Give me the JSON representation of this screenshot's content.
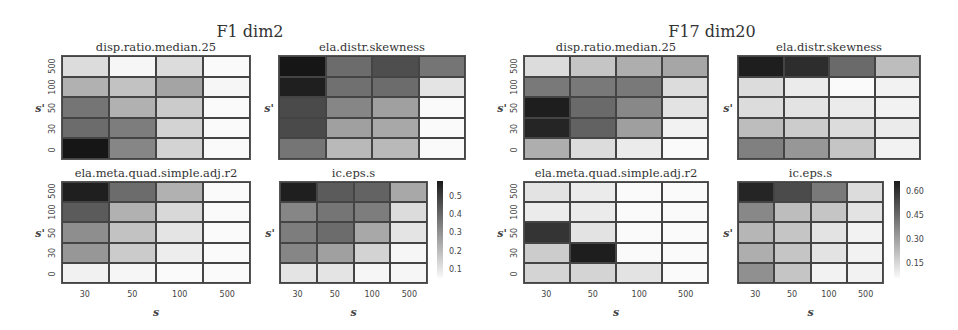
{
  "chart_data": [
    {
      "type": "heatmap",
      "group": "F1 dim2",
      "title": "disp.ratio.median.25",
      "xlabel": "s",
      "ylabel": "s'",
      "x_categories": [
        "30",
        "50",
        "100",
        "500"
      ],
      "y_categories": [
        "500",
        "100",
        "50",
        "30",
        "0"
      ],
      "values": [
        [
          0.12,
          0.06,
          0.12,
          0.05
        ],
        [
          0.22,
          0.18,
          0.25,
          0.06
        ],
        [
          0.36,
          0.22,
          0.16,
          0.05
        ],
        [
          0.38,
          0.34,
          0.14,
          0.05
        ],
        [
          0.58,
          0.32,
          0.14,
          0.05
        ]
      ]
    },
    {
      "type": "heatmap",
      "group": "F1 dim2",
      "title": "ela.distr.skewness",
      "xlabel": "s",
      "ylabel": "s'",
      "x_categories": [
        "30",
        "50",
        "100",
        "500"
      ],
      "y_categories": [
        "500",
        "100",
        "50",
        "30",
        "0"
      ],
      "values": [
        [
          0.58,
          0.38,
          0.45,
          0.36
        ],
        [
          0.56,
          0.37,
          0.38,
          0.1
        ],
        [
          0.46,
          0.32,
          0.26,
          0.05
        ],
        [
          0.46,
          0.26,
          0.24,
          0.05
        ],
        [
          0.36,
          0.2,
          0.2,
          0.05
        ]
      ]
    },
    {
      "type": "heatmap",
      "group": "F1 dim2",
      "title": "ela.meta.quad.simple.adj.r2",
      "xlabel": "s",
      "ylabel": "s'",
      "x_categories": [
        "30",
        "50",
        "100",
        "500"
      ],
      "y_categories": [
        "500",
        "100",
        "50",
        "30",
        "0"
      ],
      "values": [
        [
          0.56,
          0.38,
          0.22,
          0.05
        ],
        [
          0.42,
          0.22,
          0.13,
          0.05
        ],
        [
          0.3,
          0.18,
          0.1,
          0.05
        ],
        [
          0.28,
          0.16,
          0.08,
          0.05
        ],
        [
          0.07,
          0.06,
          0.05,
          0.05
        ]
      ]
    },
    {
      "type": "heatmap",
      "group": "F1 dim2",
      "title": "ic.eps.s",
      "xlabel": "s",
      "ylabel": "s'",
      "x_categories": [
        "30",
        "50",
        "100",
        "500"
      ],
      "y_categories": [
        "500",
        "100",
        "50",
        "30",
        "0"
      ],
      "values": [
        [
          0.56,
          0.42,
          0.4,
          0.24
        ],
        [
          0.32,
          0.36,
          0.34,
          0.12
        ],
        [
          0.34,
          0.38,
          0.24,
          0.1
        ],
        [
          0.32,
          0.26,
          0.14,
          0.06
        ],
        [
          0.1,
          0.1,
          0.06,
          0.06
        ]
      ],
      "colorbar": {
        "ticks": [
          "0.5",
          "0.4",
          "0.3",
          "0.2",
          "0.1"
        ],
        "range": [
          0.05,
          0.58
        ]
      }
    },
    {
      "type": "heatmap",
      "group": "F17 dim20",
      "title": "disp.ratio.median.25",
      "xlabel": "s",
      "ylabel": "s'",
      "x_categories": [
        "30",
        "50",
        "100",
        "500"
      ],
      "y_categories": [
        "500",
        "100",
        "50",
        "30",
        "0"
      ],
      "values": [
        [
          0.14,
          0.2,
          0.26,
          0.28
        ],
        [
          0.4,
          0.4,
          0.4,
          0.14
        ],
        [
          0.64,
          0.44,
          0.36,
          0.12
        ],
        [
          0.62,
          0.46,
          0.3,
          0.08
        ],
        [
          0.26,
          0.14,
          0.1,
          0.06
        ]
      ]
    },
    {
      "type": "heatmap",
      "group": "F17 dim20",
      "title": "ela.distr.skewness",
      "xlabel": "s",
      "ylabel": "s'",
      "x_categories": [
        "30",
        "50",
        "100",
        "500"
      ],
      "y_categories": [
        "500",
        "100",
        "50",
        "30",
        "0"
      ],
      "values": [
        [
          0.64,
          0.6,
          0.44,
          0.22
        ],
        [
          0.14,
          0.1,
          0.06,
          0.08
        ],
        [
          0.14,
          0.12,
          0.1,
          0.08
        ],
        [
          0.22,
          0.18,
          0.14,
          0.1
        ],
        [
          0.38,
          0.32,
          0.2,
          0.08
        ]
      ]
    },
    {
      "type": "heatmap",
      "group": "F17 dim20",
      "title": "ela.meta.quad.simple.adj.r2",
      "xlabel": "s",
      "ylabel": "s'",
      "x_categories": [
        "30",
        "50",
        "100",
        "500"
      ],
      "y_categories": [
        "500",
        "100",
        "50",
        "30",
        "0"
      ],
      "values": [
        [
          0.12,
          0.1,
          0.06,
          0.06
        ],
        [
          0.1,
          0.1,
          0.06,
          0.06
        ],
        [
          0.58,
          0.12,
          0.06,
          0.06
        ],
        [
          0.18,
          0.64,
          0.06,
          0.06
        ],
        [
          0.16,
          0.16,
          0.12,
          0.06
        ]
      ]
    },
    {
      "type": "heatmap",
      "group": "F17 dim20",
      "title": "ic.eps.s",
      "xlabel": "s",
      "ylabel": "s'",
      "x_categories": [
        "30",
        "50",
        "100",
        "500"
      ],
      "y_categories": [
        "500",
        "100",
        "50",
        "30",
        "0"
      ],
      "values": [
        [
          0.62,
          0.52,
          0.4,
          0.14
        ],
        [
          0.36,
          0.22,
          0.2,
          0.12
        ],
        [
          0.24,
          0.2,
          0.12,
          0.08
        ],
        [
          0.26,
          0.2,
          0.12,
          0.08
        ],
        [
          0.34,
          0.2,
          0.08,
          0.08
        ]
      ],
      "colorbar": {
        "ticks": [
          "0.60",
          "0.45",
          "0.30",
          "0.15"
        ],
        "range": [
          0.06,
          0.66
        ]
      }
    }
  ],
  "groups": [
    {
      "title": "F1 dim2"
    },
    {
      "title": "F17 dim20"
    }
  ],
  "axis": {
    "xlabel": "s",
    "ylabel": "s'"
  }
}
